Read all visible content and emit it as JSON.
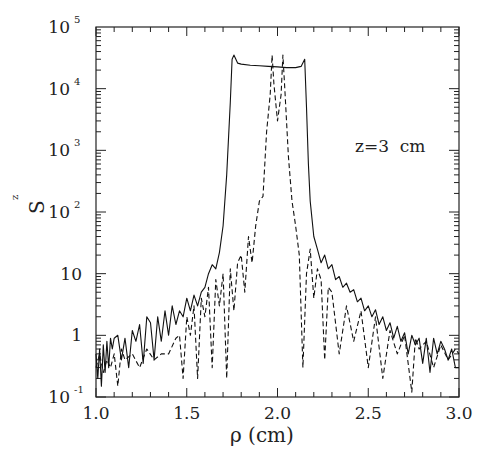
{
  "chart_data": {
    "type": "line",
    "title": "",
    "xlabel": "ρ (cm)",
    "ylabel": "S_z",
    "xlim": [
      1.0,
      3.0
    ],
    "ylim": [
      0.1,
      100000
    ],
    "yscale": "log",
    "grid": false,
    "legend": null,
    "annotation": "z=3  cm",
    "x_ticks": [
      {
        "value": 1.0,
        "label": "1.0"
      },
      {
        "value": 1.5,
        "label": "1.5"
      },
      {
        "value": 2.0,
        "label": "2.0"
      },
      {
        "value": 2.5,
        "label": "2.5"
      },
      {
        "value": 3.0,
        "label": "3.0"
      }
    ],
    "y_ticks": [
      {
        "value": 100000,
        "base": "10",
        "exp": "5"
      },
      {
        "value": 10000,
        "base": "10",
        "exp": "4"
      },
      {
        "value": 1000,
        "base": "10",
        "exp": "3"
      },
      {
        "value": 100,
        "base": "10",
        "exp": "2"
      },
      {
        "value": 10,
        "base": "10",
        "exp": ""
      },
      {
        "value": 1,
        "base": "1",
        "exp": ""
      },
      {
        "value": 0.1,
        "base": "10",
        "exp": "-1"
      }
    ],
    "series": [
      {
        "name": "solid",
        "style": "solid",
        "x": [
          1.0,
          1.01,
          1.02,
          1.03,
          1.04,
          1.05,
          1.06,
          1.07,
          1.08,
          1.09,
          1.1,
          1.12,
          1.14,
          1.16,
          1.18,
          1.2,
          1.22,
          1.24,
          1.26,
          1.28,
          1.3,
          1.32,
          1.34,
          1.36,
          1.38,
          1.4,
          1.42,
          1.44,
          1.46,
          1.48,
          1.5,
          1.52,
          1.54,
          1.56,
          1.58,
          1.6,
          1.62,
          1.64,
          1.66,
          1.68,
          1.7,
          1.72,
          1.74,
          1.75,
          1.76,
          1.78,
          1.8,
          1.85,
          1.9,
          1.95,
          2.0,
          2.05,
          2.1,
          2.13,
          2.15,
          2.16,
          2.17,
          2.18,
          2.2,
          2.22,
          2.24,
          2.26,
          2.28,
          2.3,
          2.32,
          2.34,
          2.36,
          2.38,
          2.4,
          2.42,
          2.44,
          2.46,
          2.48,
          2.5,
          2.52,
          2.54,
          2.56,
          2.58,
          2.6,
          2.62,
          2.64,
          2.66,
          2.68,
          2.7,
          2.72,
          2.74,
          2.76,
          2.78,
          2.8,
          2.82,
          2.84,
          2.86,
          2.88,
          2.9,
          2.92,
          2.94,
          2.96,
          2.98,
          3.0
        ],
        "y": [
          0.5,
          0.2,
          0.6,
          0.15,
          0.7,
          0.25,
          0.8,
          0.3,
          0.9,
          0.6,
          0.9,
          1.0,
          0.4,
          0.9,
          0.3,
          1.2,
          0.8,
          1.5,
          0.35,
          2.0,
          1.6,
          0.4,
          2.0,
          0.8,
          2.5,
          1.0,
          3.0,
          1.5,
          2.5,
          2.0,
          4.0,
          2.5,
          4.5,
          3.0,
          5.0,
          6.0,
          10,
          14,
          12,
          22,
          60,
          400,
          6000,
          30000,
          35000,
          26000,
          25000,
          24000,
          23500,
          23000,
          22500,
          22000,
          22000,
          23000,
          30000,
          5000,
          600,
          150,
          40,
          25,
          15,
          20,
          12,
          14,
          8,
          9,
          6,
          7,
          5,
          5.5,
          3.5,
          4,
          2.5,
          3,
          2,
          2.6,
          1.5,
          2,
          1.2,
          1.6,
          0.9,
          1.4,
          0.8,
          1.1,
          0.5,
          1.0,
          0.7,
          0.9,
          0.35,
          0.9,
          0.25,
          0.9,
          0.5,
          0.8,
          0.6,
          0.4,
          0.6,
          0.3,
          0.3
        ]
      },
      {
        "name": "dashed",
        "style": "dashed",
        "x": [
          1.0,
          1.02,
          1.04,
          1.06,
          1.08,
          1.1,
          1.12,
          1.14,
          1.16,
          1.2,
          1.24,
          1.28,
          1.32,
          1.36,
          1.4,
          1.44,
          1.46,
          1.48,
          1.5,
          1.52,
          1.54,
          1.56,
          1.58,
          1.6,
          1.62,
          1.64,
          1.66,
          1.68,
          1.7,
          1.72,
          1.74,
          1.76,
          1.78,
          1.8,
          1.82,
          1.84,
          1.86,
          1.88,
          1.9,
          1.92,
          1.94,
          1.96,
          1.97,
          1.98,
          2.0,
          2.02,
          2.03,
          2.04,
          2.06,
          2.08,
          2.1,
          2.12,
          2.14,
          2.16,
          2.18,
          2.2,
          2.22,
          2.24,
          2.26,
          2.28,
          2.3,
          2.34,
          2.38,
          2.42,
          2.46,
          2.5,
          2.54,
          2.58,
          2.62,
          2.66,
          2.7,
          2.74,
          2.76,
          2.78,
          2.82,
          2.86,
          2.9,
          2.94,
          2.98,
          3.0
        ],
        "y": [
          0.3,
          0.5,
          0.25,
          0.4,
          0.3,
          0.5,
          0.15,
          0.6,
          0.4,
          0.5,
          0.3,
          0.6,
          0.4,
          0.5,
          0.5,
          0.9,
          1.0,
          0.2,
          2.0,
          1.0,
          3.0,
          0.2,
          4.0,
          2.0,
          6.0,
          0.3,
          8.0,
          3.0,
          10,
          0.2,
          12,
          2.5,
          15,
          20,
          5,
          40,
          15,
          60,
          150,
          180,
          2000,
          8000,
          35000,
          12000,
          3000,
          8000,
          35000,
          10000,
          800,
          150,
          60,
          20,
          0.3,
          10,
          25,
          4,
          12,
          8,
          0.4,
          6,
          5,
          0.5,
          3,
          0.8,
          2.5,
          0.3,
          2,
          0.2,
          1.2,
          0.5,
          1.0,
          0.12,
          0.9,
          0.6,
          0.8,
          0.3,
          0.7,
          0.4,
          0.6,
          0.5
        ]
      }
    ]
  }
}
